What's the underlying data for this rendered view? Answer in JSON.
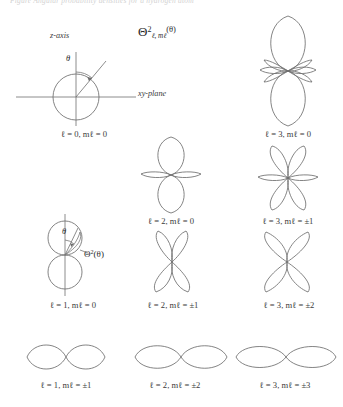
{
  "figure": {
    "clipped_header_text": "Figure  Angular probability densities for a hydrogen atom",
    "title_symbol": {
      "base": "Θ",
      "superscript": "2",
      "subscript": "ℓ, mℓ",
      "argument": "(θ)"
    },
    "line_color": "#6e6e6e",
    "background_color": "#ffffff",
    "text_color": "#2b2b2b"
  },
  "reference_panel": {
    "z_axis_label": "z-axis",
    "xy_plane_label": "xy-plane",
    "theta_label": "θ"
  },
  "theta_squared_panel": {
    "theta_label": "θ",
    "function_label_base": "Θ",
    "function_label_sup": "2",
    "function_label_arg": "(θ)"
  },
  "panels": [
    {
      "id": "l0-m0",
      "kind": "reference-sphere",
      "caption_l": "ℓ = 0,",
      "caption_m_base": " m",
      "caption_m_sub": "ℓ",
      "caption_m_val": " = 0",
      "caption_full": "ℓ = 0, mℓ = 0",
      "row": 1,
      "col": 1
    },
    {
      "id": "l2-m0",
      "kind": "polar",
      "lobes": "two vertical lobes with small horizontal waist lobes",
      "caption_full": "ℓ = 2, mℓ = 0",
      "row": 2,
      "col": 2
    },
    {
      "id": "l3-m0",
      "kind": "polar",
      "lobes": "two large vertical lobes with small starred waist lobes",
      "caption_full": "ℓ = 3, mℓ = 0",
      "row": 1,
      "col": 3
    },
    {
      "id": "l3-m1",
      "kind": "polar",
      "lobes": "four tilted lobes plus two small horizontal lobes",
      "caption_full": "ℓ = 3, mℓ = ±1",
      "row": 2,
      "col": 3
    },
    {
      "id": "l1-m0",
      "kind": "reference-two-circles",
      "caption_full": "ℓ = 1, mℓ = 0",
      "row": 3,
      "col": 1
    },
    {
      "id": "l2-m1",
      "kind": "polar",
      "lobes": "four-lobed clover tilted at 45 degrees",
      "caption_full": "ℓ = 2, mℓ = ±1",
      "row": 3,
      "col": 2
    },
    {
      "id": "l3-m2",
      "kind": "polar",
      "lobes": "four-lobed clover tilted at 45 degrees, broader",
      "caption_full": "ℓ = 3, mℓ = ±2",
      "row": 3,
      "col": 3
    },
    {
      "id": "l1-m1",
      "kind": "polar",
      "lobes": "horizontal figure-eight (two round lobes)",
      "caption_full": "ℓ = 1, mℓ = ±1",
      "row": 4,
      "col": 1
    },
    {
      "id": "l2-m2",
      "kind": "polar",
      "lobes": "horizontal figure-eight (elongated lobes)",
      "caption_full": "ℓ = 2, mℓ = ±2",
      "row": 4,
      "col": 2
    },
    {
      "id": "l3-m3",
      "kind": "polar",
      "lobes": "horizontal figure-eight (flattest, widest lobes)",
      "caption_full": "ℓ = 3, mℓ = ±3",
      "row": 4,
      "col": 3
    }
  ],
  "captions": {
    "l0_m0": "ℓ = 0, mℓ = 0",
    "l3_m0": "ℓ = 3, mℓ = 0",
    "l2_m0": "ℓ = 2, mℓ = 0",
    "l3_m1": "ℓ = 3, mℓ = ±1",
    "l1_m0": "ℓ = 1, mℓ = 0",
    "l2_m1": "ℓ = 2, mℓ = ±1",
    "l3_m2": "ℓ = 3, mℓ = ±2",
    "l1_m1": "ℓ = 1, mℓ = ±1",
    "l2_m2": "ℓ = 2, mℓ = ±2",
    "l3_m3": "ℓ = 3, mℓ = ±3"
  }
}
